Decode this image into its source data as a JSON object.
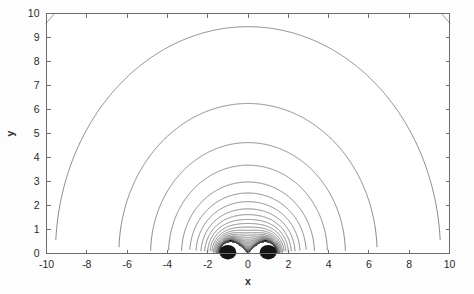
{
  "figure": {
    "background_color": "#fdfdfd",
    "plot_background_color": "#ffffff",
    "frame_color": "#6b6b6b",
    "contour_color": "#4a4a4a"
  },
  "axes": {
    "x_title": "x",
    "y_title": "y",
    "x_tick_labels": [
      "-10",
      "-8",
      "-6",
      "-4",
      "-2",
      "0",
      "2",
      "4",
      "6",
      "8",
      "10"
    ],
    "y_tick_labels": [
      "0",
      "1",
      "2",
      "3",
      "4",
      "5",
      "6",
      "7",
      "8",
      "9",
      "10"
    ]
  },
  "chart_data": {
    "type": "line",
    "title": "",
    "subtitle": "",
    "xlabel": "x",
    "ylabel": "y",
    "xlim": [
      -10,
      10
    ],
    "ylim": [
      0,
      10
    ],
    "xticks": [
      -10,
      -8,
      -6,
      -4,
      -2,
      0,
      2,
      4,
      6,
      8,
      10
    ],
    "yticks": [
      0,
      1,
      2,
      3,
      4,
      5,
      6,
      7,
      8,
      9,
      10
    ],
    "grid": false,
    "legend": null,
    "legend_position": "none",
    "annotations": [],
    "sources": [
      {
        "name": "source-left",
        "x": -1.0,
        "y": 0.0
      },
      {
        "name": "source-right",
        "x": 1.0,
        "y": 0.0
      }
    ],
    "series": [
      {
        "name": "contour-level-1",
        "apex_y": 9.45,
        "half_width_x": 4.85,
        "closed": true,
        "note": "largest closed contour, apex near y=9.45"
      },
      {
        "name": "contour-level-2",
        "apex_y": 6.25,
        "half_width_x": 3.3,
        "closed": true
      },
      {
        "name": "contour-level-3",
        "apex_y": 4.62,
        "half_width_x": 2.55,
        "closed": true
      },
      {
        "name": "contour-level-4",
        "apex_y": 3.68,
        "half_width_x": 2.2,
        "closed": true
      },
      {
        "name": "contour-level-5",
        "apex_y": 2.98,
        "half_width_x": 1.98,
        "closed": true
      },
      {
        "name": "contour-level-6",
        "apex_y": 2.52,
        "half_width_x": 1.85,
        "closed": true
      },
      {
        "name": "contour-level-7",
        "apex_y": 2.16,
        "half_width_x": 1.76,
        "closed": true
      },
      {
        "name": "contour-level-8",
        "apex_y": 1.86,
        "half_width_x": 1.69,
        "closed": true
      },
      {
        "name": "contour-level-9",
        "apex_y": 1.62,
        "half_width_x": 1.63,
        "closed": true
      },
      {
        "name": "contour-level-10",
        "apex_y": 1.42,
        "half_width_x": 1.58,
        "closed": true
      },
      {
        "name": "contour-level-11",
        "apex_y": 1.25,
        "half_width_x": 1.54,
        "closed": true
      },
      {
        "name": "contour-level-12",
        "apex_y": 1.1,
        "half_width_x": 1.5,
        "closed": true
      },
      {
        "name": "contour-level-13",
        "apex_y": 0.97,
        "half_width_x": 1.46,
        "closed": true
      },
      {
        "name": "contour-level-14",
        "apex_y": 0.86,
        "half_width_x": 1.43,
        "closed": true
      },
      {
        "name": "contour-level-15",
        "apex_y": 0.76,
        "half_width_x": 1.4,
        "closed": true
      },
      {
        "name": "contour-level-16",
        "apex_y": 0.67,
        "half_width_x": 1.37,
        "closed": true
      },
      {
        "name": "contour-level-17",
        "apex_y": 0.59,
        "half_width_x": 1.35,
        "closed": true
      },
      {
        "name": "contour-level-18",
        "apex_y": 0.52,
        "half_width_x": 1.33,
        "closed": true
      },
      {
        "name": "contour-level-19",
        "apex_y": 0.46,
        "half_width_x": 1.31,
        "closed": true
      },
      {
        "name": "contour-level-20",
        "apex_y": 0.4,
        "half_width_x": 1.29,
        "closed": true
      },
      {
        "name": "contour-outer-open",
        "apex_y": 10.0,
        "x_at_top_left": -9.45,
        "x_at_top_right": 9.7,
        "x_at_bottom_left": -1.75,
        "x_at_bottom_right": 1.85,
        "closed": false,
        "note": "outermost open contour exiting the top frame edge"
      }
    ]
  }
}
